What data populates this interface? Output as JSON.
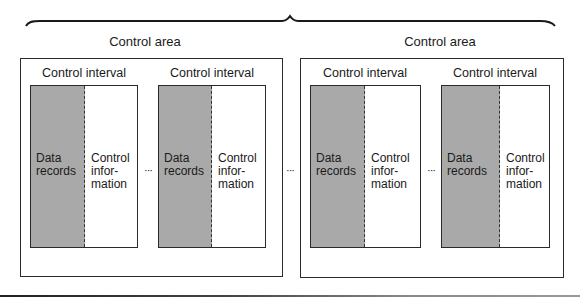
{
  "diagram": {
    "type": "VSAM data set structure",
    "brace": {
      "spans": "both control areas"
    },
    "control_areas": [
      {
        "label": "Control area",
        "intervals": [
          {
            "label": "Control interval",
            "data_text": [
              "Data",
              "records"
            ],
            "control_text": [
              "Control",
              "infor-",
              "mation"
            ]
          },
          {
            "label": "Control interval",
            "data_text": [
              "Data",
              "records"
            ],
            "control_text": [
              "Control",
              "infor-",
              "mation"
            ]
          }
        ],
        "ellipsis": "···"
      },
      {
        "label": "Control area",
        "intervals": [
          {
            "label": "Control interval",
            "data_text": [
              "Data",
              "records"
            ],
            "control_text": [
              "Control",
              "infor-",
              "mation"
            ]
          },
          {
            "label": "Control interval",
            "data_text": [
              "Data",
              "records"
            ],
            "control_text": [
              "Control",
              "infor-",
              "mation"
            ]
          }
        ],
        "ellipsis": "···"
      }
    ],
    "between_areas_ellipsis": "···",
    "colors": {
      "data_fill": "#a9a9a9",
      "line": "#2a2a2a",
      "background": "#ffffff"
    }
  }
}
